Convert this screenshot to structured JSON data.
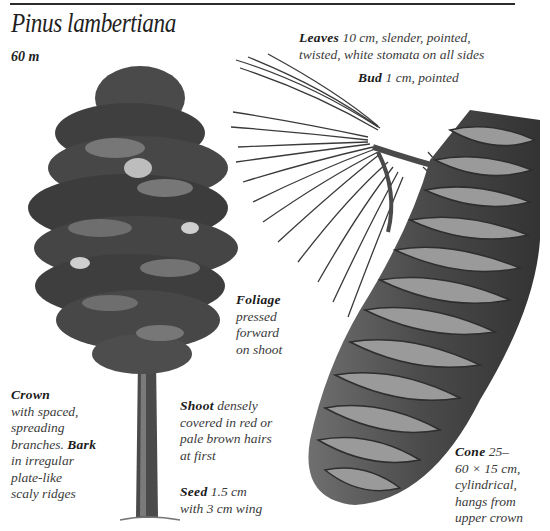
{
  "page": {
    "title": "Pinus lambertiana",
    "height": "60 m"
  },
  "captions": {
    "leaves": {
      "term": "Leaves",
      "line1": "10 cm, slender, pointed,",
      "line2": "twisted, white stomata on all sides"
    },
    "bud": {
      "term": "Bud",
      "text": "1 cm, pointed"
    },
    "foliage": {
      "term": "Foliage",
      "lines": [
        "pressed",
        "forward",
        "on shoot"
      ]
    },
    "crown": {
      "term": "Crown",
      "lines": [
        "with spaced,",
        "spreading",
        "branches."
      ],
      "bark_term": "Bark",
      "bark_lines": [
        "in irregular",
        "plate-like",
        "scaly ridges"
      ]
    },
    "shoot": {
      "term": "Shoot",
      "line1": "densely",
      "lines": [
        "covered in red or",
        "pale brown hairs",
        "at first"
      ]
    },
    "seed": {
      "term": "Seed",
      "line1": "1.5 cm",
      "line2": "with 3 cm wing"
    },
    "cone": {
      "term": "Cone",
      "line1": "25–",
      "lines": [
        "60 × 15 cm,",
        "cylindrical,",
        "hangs from",
        "upper crown"
      ]
    }
  },
  "illustrations": {
    "tree": "sugar-pine-tree",
    "shoot": "needle-shoot-with-bud",
    "cone": "long-hanging-cone"
  },
  "colors": {
    "ink": "#2a2a2a",
    "foliage_dark": "#3d3d3d",
    "foliage_mid": "#6a6a6a",
    "cone_dark": "#3a3a3a",
    "cone_light": "#9a9a9a",
    "background": "#ffffff"
  }
}
